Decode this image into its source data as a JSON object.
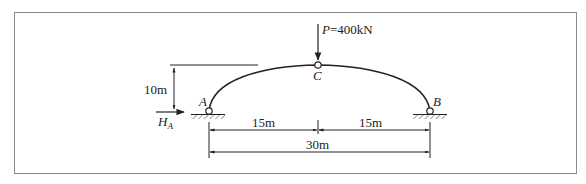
{
  "figure": {
    "border_color": "#8a8a8a",
    "line_color": "#222222",
    "load": {
      "symbol": "P",
      "equals": "=",
      "value": "400kN",
      "label": "P=400kN"
    },
    "points": {
      "A": "A",
      "B": "B",
      "C": "C"
    },
    "reaction": {
      "symbol": "H",
      "subscript": "A"
    },
    "dimensions": {
      "rise": "10m",
      "left_half": "15m",
      "right_half": "15m",
      "span": "30m"
    }
  }
}
